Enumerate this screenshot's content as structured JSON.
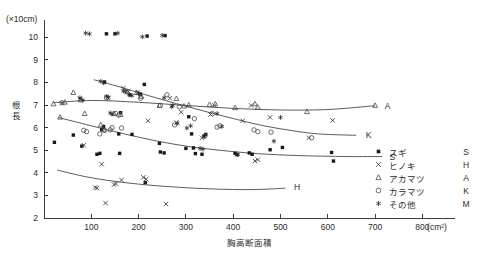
{
  "figure": {
    "y_unit_label": "(×10cm)",
    "y_axis_title": "根長",
    "x_axis_title": "胸高断面積",
    "x_unit_label": "(cm²)"
  },
  "axes": {
    "y_ticks": [
      2,
      3,
      4,
      5,
      6,
      7,
      8,
      9,
      10
    ],
    "x_ticks": [
      100,
      200,
      300,
      400,
      500,
      600,
      700,
      800
    ],
    "xlim": [
      0,
      860
    ],
    "ylim": [
      2,
      10.6
    ],
    "grid": false
  },
  "legend": {
    "position": "bottom-right",
    "entries": [
      {
        "symbol": "filled-square",
        "name": "スギ",
        "code": "S"
      },
      {
        "symbol": "x-mark",
        "name": "ヒノキ",
        "code": "H"
      },
      {
        "symbol": "triangle",
        "name": "アカマツ",
        "code": "A"
      },
      {
        "symbol": "circle",
        "name": "カラマツ",
        "code": "K"
      },
      {
        "symbol": "asterisk",
        "name": "その他",
        "code": "M"
      }
    ]
  },
  "curve_labels": [
    {
      "code": "A",
      "x": 712,
      "y": 6.97
    },
    {
      "code": "K",
      "x": 672,
      "y": 5.66
    },
    {
      "code": "S",
      "x": 722,
      "y": 4.72
    },
    {
      "code": "H",
      "x": 520,
      "y": 3.37
    }
  ],
  "chart_data": {
    "type": "scatter",
    "title": "",
    "xlabel": "胸高断面積",
    "ylabel": "根長",
    "xunit": "cm²",
    "yunit": "×10cm",
    "xlim": [
      0,
      860
    ],
    "ylim": [
      2,
      10.6
    ],
    "grid": false,
    "series": [
      {
        "name": "スギ",
        "code": "S",
        "symbol": "filled-square",
        "points": [
          [
            22,
            5.35
          ],
          [
            62,
            5.67
          ],
          [
            80,
            5.18
          ],
          [
            112,
            4.82
          ],
          [
            118,
            4.86
          ],
          [
            122,
            5.92
          ],
          [
            126,
            6.05
          ],
          [
            128,
            8.02
          ],
          [
            132,
            10.15
          ],
          [
            150,
            10.15
          ],
          [
            158,
            5.72
          ],
          [
            160,
            4.86
          ],
          [
            162,
            6.66
          ],
          [
            182,
            7.45
          ],
          [
            186,
            5.7
          ],
          [
            204,
            7.48
          ],
          [
            212,
            7.91
          ],
          [
            214,
            3.57
          ],
          [
            218,
            10.05
          ],
          [
            244,
            5.3
          ],
          [
            246,
            4.92
          ],
          [
            254,
            4.88
          ],
          [
            256,
            10.07
          ],
          [
            300,
            5.08
          ],
          [
            306,
            6.48
          ],
          [
            312,
            5.72
          ],
          [
            316,
            5.1
          ],
          [
            320,
            4.85
          ],
          [
            334,
            4.82
          ],
          [
            338,
            5.62
          ],
          [
            342,
            5.7
          ],
          [
            404,
            4.86
          ],
          [
            408,
            4.8
          ],
          [
            434,
            4.88
          ],
          [
            440,
            4.82
          ],
          [
            478,
            5.02
          ],
          [
            504,
            5.12
          ],
          [
            608,
            4.9
          ],
          [
            612,
            4.52
          ]
        ]
      },
      {
        "name": "ヒノキ",
        "code": "H",
        "symbol": "x-mark",
        "points": [
          [
            38,
            7.08
          ],
          [
            76,
            7.27
          ],
          [
            84,
            5.22
          ],
          [
            108,
            3.35
          ],
          [
            112,
            3.32
          ],
          [
            122,
            4.38
          ],
          [
            130,
            2.66
          ],
          [
            136,
            7.3
          ],
          [
            148,
            3.48
          ],
          [
            152,
            3.52
          ],
          [
            164,
            3.68
          ],
          [
            168,
            7.75
          ],
          [
            178,
            7.6
          ],
          [
            198,
            7.55
          ],
          [
            210,
            3.8
          ],
          [
            216,
            3.72
          ],
          [
            220,
            6.3
          ],
          [
            258,
            2.62
          ],
          [
            266,
            7.3
          ],
          [
            280,
            6.22
          ],
          [
            290,
            6.68
          ],
          [
            334,
            5.55
          ],
          [
            352,
            6.58
          ],
          [
            360,
            6.98
          ],
          [
            420,
            6.3
          ],
          [
            438,
            6.98
          ],
          [
            446,
            4.52
          ],
          [
            452,
            4.58
          ],
          [
            478,
            6.45
          ],
          [
            560,
            5.55
          ],
          [
            610,
            6.32
          ]
        ]
      },
      {
        "name": "アカマツ",
        "code": "A",
        "symbol": "triangle",
        "points": [
          [
            20,
            7.05
          ],
          [
            34,
            6.46
          ],
          [
            44,
            7.12
          ],
          [
            62,
            7.55
          ],
          [
            78,
            7.22
          ],
          [
            86,
            6.62
          ],
          [
            120,
            6.12
          ],
          [
            126,
            5.9
          ],
          [
            148,
            6.62
          ],
          [
            162,
            6.58
          ],
          [
            176,
            7.58
          ],
          [
            196,
            7.55
          ],
          [
            206,
            7.38
          ],
          [
            244,
            6.98
          ],
          [
            280,
            7.28
          ],
          [
            296,
            6.95
          ],
          [
            306,
            7.0
          ],
          [
            350,
            7.02
          ],
          [
            362,
            7.05
          ],
          [
            404,
            6.88
          ],
          [
            446,
            7.05
          ],
          [
            452,
            6.9
          ],
          [
            556,
            6.7
          ],
          [
            700,
            6.98
          ]
        ]
      },
      {
        "name": "カラマツ",
        "code": "K",
        "symbol": "circle",
        "points": [
          [
            38,
            7.1
          ],
          [
            84,
            5.88
          ],
          [
            90,
            5.82
          ],
          [
            118,
            5.72
          ],
          [
            128,
            5.88
          ],
          [
            132,
            7.32
          ],
          [
            140,
            5.9
          ],
          [
            144,
            6.0
          ],
          [
            152,
            6.62
          ],
          [
            158,
            6.55
          ],
          [
            164,
            5.98
          ],
          [
            204,
            7.3
          ],
          [
            246,
            6.98
          ],
          [
            260,
            7.45
          ],
          [
            276,
            6.12
          ],
          [
            286,
            6.92
          ],
          [
            318,
            6.4
          ],
          [
            340,
            5.62
          ],
          [
            356,
            6.62
          ],
          [
            366,
            6.02
          ],
          [
            372,
            6.08
          ],
          [
            444,
            5.9
          ],
          [
            452,
            5.82
          ],
          [
            480,
            5.8
          ],
          [
            566,
            5.55
          ]
        ]
      },
      {
        "name": "その他",
        "code": "M",
        "symbol": "asterisk",
        "points": [
          [
            76,
            7.32
          ],
          [
            82,
            7.22
          ],
          [
            88,
            10.18
          ],
          [
            96,
            10.15
          ],
          [
            120,
            8.05
          ],
          [
            126,
            7.98
          ],
          [
            132,
            7.38
          ],
          [
            136,
            7.35
          ],
          [
            140,
            6.65
          ],
          [
            144,
            6.6
          ],
          [
            156,
            10.18
          ],
          [
            168,
            7.62
          ],
          [
            172,
            7.6
          ],
          [
            180,
            7.45
          ],
          [
            186,
            7.42
          ],
          [
            200,
            7.5
          ],
          [
            208,
            10.02
          ],
          [
            250,
            10.08
          ],
          [
            254,
            7.32
          ],
          [
            270,
            6.92
          ],
          [
            272,
            6.98
          ],
          [
            282,
            6.2
          ],
          [
            302,
            5.98
          ],
          [
            310,
            6.08
          ],
          [
            330,
            5.08
          ],
          [
            336,
            5.05
          ],
          [
            366,
            6.62
          ],
          [
            376,
            6.05
          ],
          [
            410,
            4.8
          ],
          [
            486,
            5.4
          ],
          [
            500,
            6.45
          ]
        ]
      }
    ],
    "trend_curves": [
      {
        "code": "A",
        "name": "アカマツ",
        "points": [
          [
            20,
            7.1
          ],
          [
            100,
            7.2
          ],
          [
            200,
            7.12
          ],
          [
            300,
            6.98
          ],
          [
            400,
            6.85
          ],
          [
            500,
            6.78
          ],
          [
            600,
            6.8
          ],
          [
            700,
            6.97
          ]
        ]
      },
      {
        "code": "K",
        "name": "カラマツ",
        "points": [
          [
            105,
            8.12
          ],
          [
            160,
            7.8
          ],
          [
            220,
            7.42
          ],
          [
            280,
            7.06
          ],
          [
            340,
            6.72
          ],
          [
            400,
            6.4
          ],
          [
            460,
            6.1
          ],
          [
            520,
            5.88
          ],
          [
            580,
            5.72
          ],
          [
            660,
            5.66
          ]
        ]
      },
      {
        "code": "S",
        "name": "スギ",
        "points": [
          [
            30,
            6.45
          ],
          [
            100,
            6.08
          ],
          [
            170,
            5.72
          ],
          [
            240,
            5.4
          ],
          [
            310,
            5.15
          ],
          [
            380,
            4.98
          ],
          [
            450,
            4.85
          ],
          [
            540,
            4.76
          ],
          [
            640,
            4.72
          ],
          [
            715,
            4.72
          ]
        ]
      },
      {
        "code": "H",
        "name": "ヒノキ",
        "points": [
          [
            28,
            4.12
          ],
          [
            90,
            3.82
          ],
          [
            150,
            3.62
          ],
          [
            220,
            3.46
          ],
          [
            300,
            3.34
          ],
          [
            380,
            3.27
          ],
          [
            450,
            3.26
          ],
          [
            510,
            3.32
          ]
        ]
      }
    ]
  }
}
